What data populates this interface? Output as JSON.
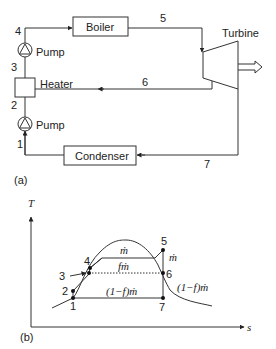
{
  "part_a": {
    "caption": "(a)",
    "components": {
      "boiler": "Boiler",
      "turbine": "Turbine",
      "heater": "Heater",
      "pump_upper": "Pump",
      "pump_lower": "Pump",
      "condenser": "Condenser"
    },
    "state_points": {
      "p1": "1",
      "p2": "2",
      "p3": "3",
      "p4": "4",
      "p5": "5",
      "p6": "6",
      "p7": "7"
    }
  },
  "part_b": {
    "caption": "(b)",
    "axes": {
      "y_label": "T",
      "x_label": "s"
    },
    "state_points": {
      "p1": "1",
      "p2": "2",
      "p3": "3",
      "p4": "4",
      "p5": "5",
      "p6": "6",
      "p7": "7"
    },
    "flow_labels": {
      "top": "ṁ",
      "middle": "fṁ",
      "bottom": "(1−f)ṁ",
      "right_upper": "ṁ",
      "right_lower": "(1−f)ṁ"
    }
  },
  "colors": {
    "line": "#333333",
    "background": "#ffffff"
  }
}
